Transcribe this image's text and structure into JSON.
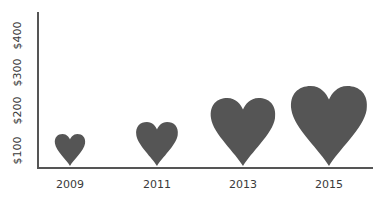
{
  "chart_data": {
    "type": "bar",
    "style": "pictograph-hearts",
    "title": "",
    "xlabel": "",
    "ylabel": "",
    "categories": [
      "2009",
      "2011",
      "2013",
      "2015"
    ],
    "values": [
      140,
      170,
      230,
      260
    ],
    "yticks": [
      "$100",
      "$200",
      "$300",
      "$400"
    ],
    "ylim": [
      60,
      450
    ],
    "grid": false,
    "legend": null,
    "color": "#555555"
  }
}
